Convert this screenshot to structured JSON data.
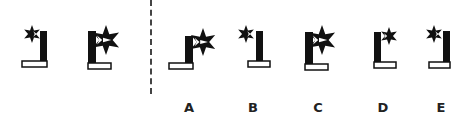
{
  "puzzle": {
    "question_figures": [
      {
        "id": "q1",
        "star_size": "small",
        "star_side": "left",
        "bar_side": "right",
        "base_direction": "left"
      },
      {
        "id": "q2",
        "star_size": "large",
        "star_side": "right",
        "bar_side": "left",
        "base_direction": "right"
      }
    ],
    "options": [
      {
        "label": "A",
        "star_size": "large",
        "star_side": "right",
        "bar_side": "left",
        "base_direction": "left"
      },
      {
        "label": "B",
        "star_size": "small",
        "star_side": "left",
        "bar_side": "right",
        "base_direction": "both"
      },
      {
        "label": "C",
        "star_size": "large",
        "star_side": "right",
        "bar_side": "left",
        "base_direction": "right"
      },
      {
        "label": "D",
        "star_size": "small",
        "star_side": "right",
        "bar_side": "left",
        "base_direction": "right"
      },
      {
        "label": "E",
        "star_size": "small",
        "star_side": "left",
        "bar_side": "right",
        "base_direction": "left"
      }
    ]
  },
  "colors": {
    "ink": "#111111",
    "background": "#ffffff",
    "divider": "#444444"
  }
}
